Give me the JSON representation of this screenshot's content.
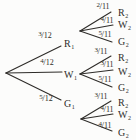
{
  "diagram": {
    "type": "probability-tree",
    "colors": {
      "line": "#2e2c29",
      "text": "#2e2c29",
      "background": "#fcfcfb"
    },
    "level1": [
      {
        "prob_num": "3",
        "prob_den": "12",
        "outcome": "R",
        "outcome_sub": "1"
      },
      {
        "prob_num": "4",
        "prob_den": "12",
        "outcome": "W",
        "outcome_sub": "1"
      },
      {
        "prob_num": "5",
        "prob_den": "12",
        "outcome": "G",
        "outcome_sub": "1"
      }
    ],
    "level2": [
      {
        "parent": "R1",
        "branches": [
          {
            "prob_num": "2",
            "prob_den": "11",
            "outcome": "R",
            "outcome_sub": "2"
          },
          {
            "prob_num": "4",
            "prob_den": "11",
            "outcome": "W",
            "outcome_sub": "2"
          },
          {
            "prob_num": "5",
            "prob_den": "11",
            "outcome": "G",
            "outcome_sub": "2"
          }
        ]
      },
      {
        "parent": "W1",
        "branches": [
          {
            "prob_num": "3",
            "prob_den": "11",
            "outcome": "R",
            "outcome_sub": "2"
          },
          {
            "prob_num": "3",
            "prob_den": "11",
            "outcome": "W",
            "outcome_sub": "2"
          },
          {
            "prob_num": "5",
            "prob_den": "11",
            "outcome": "G",
            "outcome_sub": "2"
          }
        ]
      },
      {
        "parent": "G1",
        "branches": [
          {
            "prob_num": "3",
            "prob_den": "11",
            "outcome": "R",
            "outcome_sub": "2"
          },
          {
            "prob_num": "4",
            "prob_den": "11",
            "outcome": "W",
            "outcome_sub": "2"
          },
          {
            "prob_num": "4",
            "prob_den": "11",
            "outcome": "G",
            "outcome_sub": "2"
          }
        ]
      }
    ]
  }
}
